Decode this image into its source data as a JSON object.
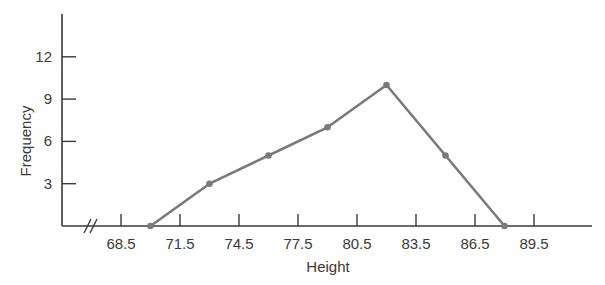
{
  "chart_data": {
    "type": "line",
    "title": "",
    "xlabel": "Height",
    "ylabel": "Frequency",
    "x": [
      70,
      73,
      76,
      79,
      82,
      85,
      88
    ],
    "series": [
      {
        "name": "Frequency polygon",
        "values": [
          0,
          3,
          5,
          7,
          10,
          5,
          0
        ]
      }
    ],
    "x_ticks": [
      "68.5",
      "71.5",
      "74.5",
      "77.5",
      "80.5",
      "83.5",
      "86.5",
      "89.5"
    ],
    "x_tick_values": [
      68.5,
      71.5,
      74.5,
      77.5,
      80.5,
      83.5,
      86.5,
      89.5
    ],
    "y_ticks": [
      "3",
      "6",
      "9",
      "12"
    ],
    "y_tick_values": [
      3,
      6,
      9,
      12
    ],
    "ylim": [
      0,
      15
    ],
    "grid": false,
    "legend": "none",
    "axis_break": "x-axis break (//) near origin",
    "colors": {
      "line": "#7a7a7a",
      "axis": "#3a3a3a",
      "text": "#3a3a3a"
    }
  }
}
